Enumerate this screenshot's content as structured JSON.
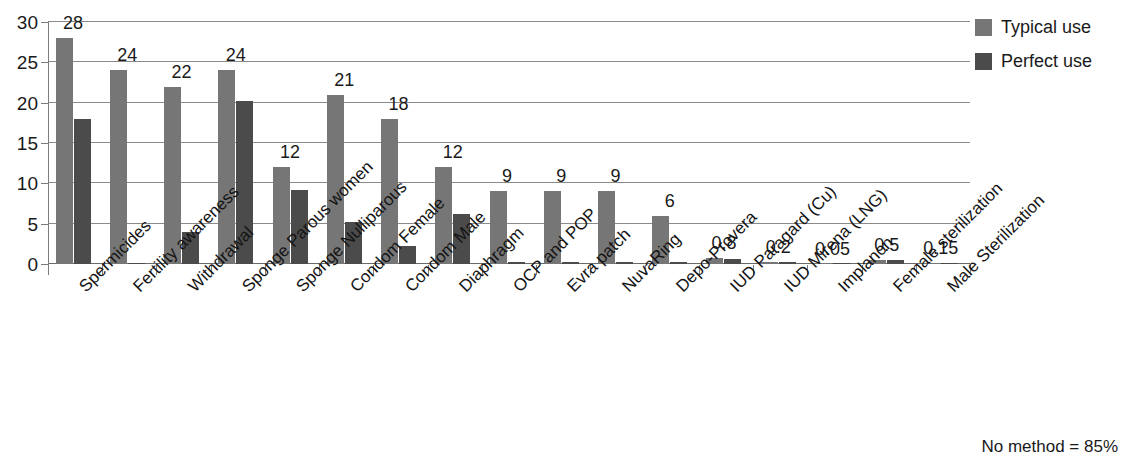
{
  "chart_data": {
    "type": "bar",
    "title": "",
    "xlabel": "",
    "ylabel": "",
    "ylim": [
      0,
      30
    ],
    "yticks": [
      0,
      5,
      10,
      15,
      20,
      25,
      30
    ],
    "grid": true,
    "legend_position": "top-right",
    "categories": [
      "Spermicides",
      "Fertility awareness",
      "Withdrawal",
      "Sponge Parous women",
      "Sponge Nulliparous",
      "Condom Female",
      "Condom Male",
      "Diaphragm",
      "OCP and POP",
      "Evra patch",
      "NuvaRing",
      "Depo-Provera",
      "IUD Paragard (Cu)",
      "IUD Mirena (LNG)",
      "Implanon",
      "Female sterilization",
      "Male Sterilization"
    ],
    "series": [
      {
        "name": "Typical use",
        "color": "#767676",
        "values": [
          28,
          24,
          22,
          24,
          12,
          21,
          18,
          12,
          9,
          9,
          9,
          6,
          0.8,
          0.2,
          0.05,
          0.5,
          0.15
        ]
      },
      {
        "name": "Perfect use",
        "color": "#4b4b4b",
        "values": [
          18,
          0,
          4,
          20.2,
          9.2,
          5.2,
          2.2,
          6.2,
          0.3,
          0.3,
          0.3,
          0.2,
          0.6,
          0.2,
          0.05,
          0.5,
          0.1
        ]
      }
    ],
    "data_labels": [
      "28",
      "24",
      "22",
      "24",
      "12",
      "21",
      "18",
      "12",
      "9",
      "9",
      "9",
      "6",
      "0.8",
      "0.2",
      "0.05",
      "0.5",
      "0.15"
    ],
    "annotation": "No method = 85%"
  },
  "legend": {
    "items": [
      {
        "label": "Typical use",
        "color": "#767676"
      },
      {
        "label": "Perfect use",
        "color": "#4b4b4b"
      }
    ]
  },
  "footnote": "No method = 85%"
}
